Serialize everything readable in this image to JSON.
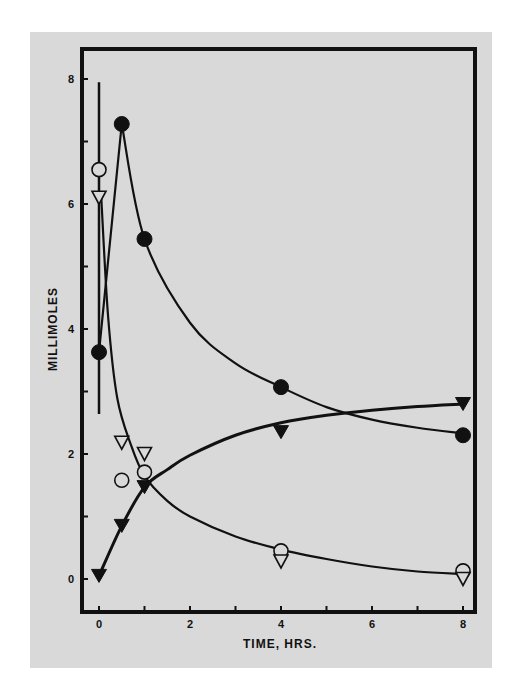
{
  "chart_data": {
    "type": "scatter",
    "title": "",
    "xlabel": "TIME, HRS.",
    "ylabel": "MILLIMOLES",
    "xlim": [
      -0.3,
      8.4
    ],
    "ylim": [
      -0.5,
      8.5
    ],
    "x_ticks": [
      0,
      2,
      4,
      6,
      8
    ],
    "x_minor_ticks": [
      1,
      3,
      5,
      7
    ],
    "y_ticks": [
      0,
      2,
      4,
      6,
      8
    ],
    "y_minor_ticks": [
      1,
      3,
      5,
      7
    ],
    "grid": false,
    "legend": null,
    "colors": {
      "panel": "#d9d9d9",
      "ink": "#111111",
      "page": "#ffffff"
    },
    "series": [
      {
        "name": "filled-circle",
        "marker": "circle-filled",
        "x": [
          0,
          0.5,
          1,
          4,
          8
        ],
        "y": [
          3.63,
          7.28,
          5.44,
          3.07,
          2.3
        ],
        "curve": [
          [
            0,
            3.63
          ],
          [
            0.5,
            7.28
          ],
          [
            1,
            5.44
          ],
          [
            2,
            4.1
          ],
          [
            3,
            3.45
          ],
          [
            4,
            3.07
          ],
          [
            5,
            2.75
          ],
          [
            6,
            2.55
          ],
          [
            7,
            2.42
          ],
          [
            8,
            2.33
          ]
        ]
      },
      {
        "name": "open-circle",
        "marker": "circle-open",
        "x": [
          0,
          0.5,
          1,
          4,
          8
        ],
        "y": [
          6.55,
          1.58,
          1.71,
          0.45,
          0.13
        ],
        "curve": null
      },
      {
        "name": "open-triangle",
        "marker": "triangle-down-open",
        "x": [
          0,
          0.5,
          1,
          4,
          8
        ],
        "y": [
          6.1,
          2.18,
          2.0,
          0.28,
          0.0
        ],
        "curve": [
          [
            0.05,
            6.1
          ],
          [
            0.2,
            4.2
          ],
          [
            0.4,
            2.9
          ],
          [
            0.7,
            2.15
          ],
          [
            1,
            1.65
          ],
          [
            1.5,
            1.25
          ],
          [
            2,
            1.0
          ],
          [
            3,
            0.68
          ],
          [
            4,
            0.47
          ],
          [
            5,
            0.32
          ],
          [
            6,
            0.2
          ],
          [
            7,
            0.12
          ],
          [
            8,
            0.08
          ]
        ]
      },
      {
        "name": "filled-triangle",
        "marker": "triangle-down-filled",
        "x": [
          0,
          0.5,
          1,
          4,
          8
        ],
        "y": [
          0.05,
          0.85,
          1.47,
          2.35,
          2.8
        ],
        "curve": [
          [
            0,
            0.05
          ],
          [
            0.5,
            0.85
          ],
          [
            1,
            1.47
          ],
          [
            1.5,
            1.75
          ],
          [
            2,
            1.98
          ],
          [
            3,
            2.3
          ],
          [
            4,
            2.5
          ],
          [
            5,
            2.62
          ],
          [
            6,
            2.7
          ],
          [
            7,
            2.76
          ],
          [
            8,
            2.8
          ]
        ]
      }
    ],
    "error_bars": [
      {
        "x": 0,
        "y_low": 2.64,
        "y_high": 7.95,
        "note": "vertical range bar at time 0"
      }
    ]
  },
  "labels": {
    "x_axis_title": "TIME, HRS.",
    "y_axis_title": "MILLIMOLES",
    "x_tick_labels": [
      "0",
      "2",
      "4",
      "6",
      "8"
    ],
    "y_tick_labels": [
      "0",
      "2",
      "4",
      "6",
      "8"
    ]
  }
}
